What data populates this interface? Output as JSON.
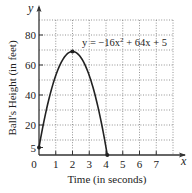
{
  "chart_data": {
    "type": "line",
    "title": "",
    "xlabel": "Time (in seconds)",
    "ylabel": "Ball's Height (in feet)",
    "x_axis_name": "x",
    "y_axis_name": "y",
    "xlim": [
      0,
      8
    ],
    "ylim": [
      0,
      90
    ],
    "grid": true,
    "x_ticks": [
      {
        "value": 0,
        "label": "0"
      },
      {
        "value": 1,
        "label": "1"
      },
      {
        "value": 2,
        "label": "2"
      },
      {
        "value": 3,
        "label": "3"
      },
      {
        "value": 4,
        "label": "4"
      },
      {
        "value": 5,
        "label": "5"
      },
      {
        "value": 6,
        "label": "6"
      },
      {
        "value": 7,
        "label": "7"
      }
    ],
    "y_ticks": [
      {
        "value": 5,
        "label": "5"
      },
      {
        "value": 20,
        "label": "20"
      },
      {
        "value": 40,
        "label": "40"
      },
      {
        "value": 60,
        "label": "60"
      },
      {
        "value": 80,
        "label": "80"
      }
    ],
    "x_gridlines": [
      1,
      2,
      3,
      4,
      5,
      6,
      7,
      8
    ],
    "y_gridlines": [
      10,
      20,
      30,
      40,
      50,
      60,
      70,
      80,
      90
    ],
    "series": [
      {
        "name": "y = -16x^2 + 64x + 5",
        "equation": {
          "a": -16,
          "b": 64,
          "c": 5
        },
        "x_range": [
          0,
          4.08
        ]
      }
    ],
    "points": [
      {
        "x": 0,
        "y": 5,
        "label": "start"
      },
      {
        "x": 2,
        "y": 69,
        "label": "vertex"
      },
      {
        "x": 4.08,
        "y": 0,
        "label": "landing"
      }
    ],
    "annotation": {
      "prefix": "y = ",
      "term1": "−16x",
      "exp": "2",
      "rest": " + 64x + 5"
    }
  }
}
